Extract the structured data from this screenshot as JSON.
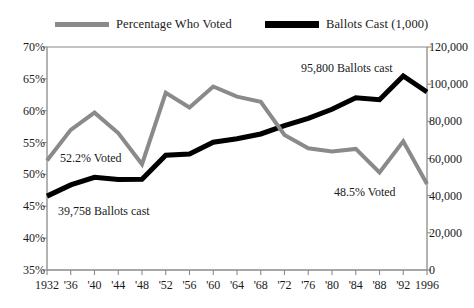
{
  "chart_data": {
    "type": "line",
    "title": "",
    "subtitle": "",
    "xlabel": "",
    "ylabel": "",
    "grid": false,
    "legend_position": "top",
    "x": [
      1932,
      1936,
      1940,
      1944,
      1948,
      1952,
      1956,
      1960,
      1964,
      1968,
      1972,
      1976,
      1980,
      1984,
      1988,
      1992,
      1996
    ],
    "categories": [
      "1932",
      "'36",
      "'40",
      "'44",
      "'48",
      "'52",
      "'56",
      "'60",
      "'64",
      "'68",
      "'72",
      "'76",
      "'80",
      "'84",
      "'88",
      "'92",
      "1996"
    ],
    "axes": {
      "left": {
        "label": "",
        "ticks": [
          "70%",
          "65%",
          "60%",
          "55%",
          "50%",
          "45%",
          "40%",
          "35%"
        ],
        "values": [
          70,
          65,
          60,
          55,
          50,
          45,
          40,
          35
        ],
        "ylim": [
          35,
          70
        ],
        "units": "percent"
      },
      "right": {
        "label": "",
        "ticks": [
          "120,000",
          "100,000",
          "80,000",
          "60,000",
          "40,000",
          "20,000",
          "0"
        ],
        "values": [
          120000,
          100000,
          80000,
          60000,
          40000,
          20000,
          0
        ],
        "ylim": [
          0,
          120000
        ],
        "units": "thousands of ballots"
      },
      "x": {
        "ticks": [
          "1932",
          "'36",
          "'40",
          "'44",
          "'48",
          "'52",
          "'56",
          "'60",
          "'64",
          "'68",
          "'72",
          "'76",
          "'80",
          "'84",
          "'88",
          "'92",
          "1996"
        ]
      }
    },
    "series": [
      {
        "name": "Percentage Who Voted",
        "axis": "left",
        "color": "#8a8a8a",
        "width": 4,
        "values": [
          52.2,
          57.0,
          59.7,
          56.5,
          51.6,
          62.8,
          60.5,
          63.8,
          62.2,
          61.4,
          56.2,
          54.1,
          53.6,
          54.0,
          50.3,
          55.2,
          48.5
        ]
      },
      {
        "name": "Ballots Cast (1,000)",
        "axis": "right",
        "color": "#000000",
        "width": 5,
        "values": [
          39758,
          45800,
          49900,
          48700,
          48800,
          61800,
          62400,
          68800,
          70600,
          73200,
          77700,
          81600,
          86500,
          92700,
          91600,
          104400,
          95800
        ]
      }
    ],
    "annotations": [
      {
        "name": "voted-1932",
        "text": "52.2% Voted"
      },
      {
        "name": "ballots-1932",
        "text": "39,758 Ballots cast"
      },
      {
        "name": "ballots-1996",
        "text": "95,800 Ballots cast"
      },
      {
        "name": "voted-1996",
        "text": "48.5% Voted"
      }
    ]
  },
  "legend": {
    "items": [
      {
        "label": "Percentage Who Voted",
        "color": "#8a8a8a"
      },
      {
        "label": "Ballots Cast (1,000)",
        "color": "#000000"
      }
    ]
  },
  "colors": {
    "percentage_line": "#8a8a8a",
    "ballots_line": "#000000",
    "axis": "#8a8a8a",
    "text": "#1a1a1a",
    "background": "#ffffff"
  }
}
